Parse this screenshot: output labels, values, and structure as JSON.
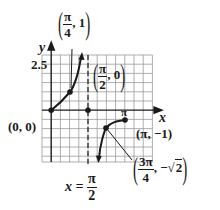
{
  "figure": {
    "axes": {
      "x_label": "x",
      "y_label": "y",
      "y_tick_label": "2.5",
      "x_tick_label": "π"
    },
    "asymptote": {
      "label_lhs": "x =",
      "label_num": "π",
      "label_den": "2"
    },
    "points": [
      {
        "id": "origin",
        "text": "(0, 0)"
      },
      {
        "id": "pi-over-4",
        "num": "π",
        "den": "4",
        "y": "1"
      },
      {
        "id": "pi-over-2",
        "num": "π",
        "den": "2",
        "y": "0"
      },
      {
        "id": "pi",
        "text": "(π, −1)"
      },
      {
        "id": "three-pi-over-4",
        "num": "3π",
        "den": "4",
        "y_sign": "−",
        "y_root": "2"
      }
    ],
    "colors": {
      "curve": "#1a1a1a",
      "grid": "#9a9a9a",
      "axis": "#1a1a1a"
    }
  }
}
